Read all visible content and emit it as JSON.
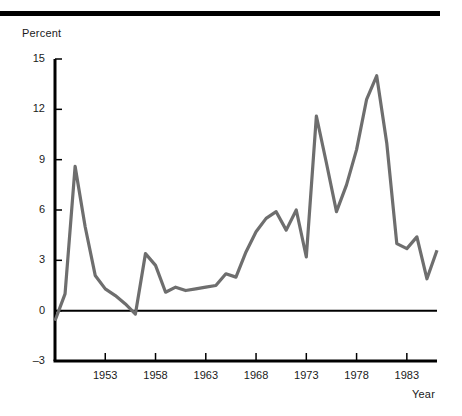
{
  "chart_data": {
    "type": "line",
    "title": "",
    "subtitle": "",
    "xlabel": "Year",
    "ylabel": "Percent",
    "xlim": [
      1948,
      1986
    ],
    "ylim": [
      -3,
      15
    ],
    "ytick_values": [
      15,
      12,
      9,
      6,
      3,
      0,
      -3
    ],
    "ytick_labels": [
      "15",
      "12",
      "9",
      "6",
      "3",
      "0",
      "–3"
    ],
    "xtick_values": [
      1953,
      1958,
      1963,
      1968,
      1973,
      1978,
      1983
    ],
    "xtick_labels": [
      "1953",
      "1958",
      "1963",
      "1968",
      "1973",
      "1978",
      "1983"
    ],
    "grid": false,
    "legend": null,
    "zero_line": 0,
    "line_color": "#6e6e6e",
    "axis_color": "#000000",
    "series": [
      {
        "name": "Percent",
        "x": [
          1948,
          1949,
          1950,
          1951,
          1952,
          1953,
          1954,
          1955,
          1956,
          1957,
          1958,
          1959,
          1960,
          1961,
          1962,
          1963,
          1964,
          1965,
          1966,
          1967,
          1968,
          1969,
          1970,
          1971,
          1972,
          1973,
          1974,
          1975,
          1976,
          1977,
          1978,
          1979,
          1980,
          1981,
          1982,
          1983,
          1984,
          1985,
          1986
        ],
        "y": [
          -0.6,
          1.0,
          8.6,
          5.0,
          2.1,
          1.3,
          0.9,
          0.4,
          -0.2,
          3.4,
          2.7,
          1.1,
          1.4,
          1.2,
          1.3,
          1.4,
          1.5,
          2.2,
          2.0,
          3.5,
          4.7,
          5.5,
          5.9,
          4.8,
          6.0,
          3.2,
          11.6,
          8.8,
          5.9,
          7.5,
          9.6,
          12.6,
          14.0,
          10.0,
          4.0,
          3.7,
          4.4,
          1.9,
          3.6
        ]
      }
    ]
  },
  "geometry": {
    "plot_left": 55,
    "plot_right": 437,
    "plot_top": 59,
    "plot_bottom": 361,
    "y_value_top": 15,
    "y_value_bottom": -3,
    "x_value_left": 1948,
    "x_value_right": 1986
  }
}
